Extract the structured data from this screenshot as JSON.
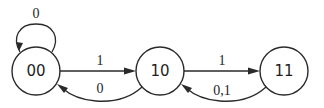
{
  "diagram": {
    "type": "state-transition",
    "states": [
      {
        "id": "s00",
        "label": "00",
        "cx": 36,
        "cy": 71,
        "r": 24
      },
      {
        "id": "s10",
        "label": "10",
        "cx": 160,
        "cy": 71,
        "r": 24
      },
      {
        "id": "s11",
        "label": "11",
        "cx": 284,
        "cy": 71,
        "r": 24
      }
    ],
    "transitions": [
      {
        "from": "00",
        "to": "00",
        "label": "0",
        "kind": "self-loop"
      },
      {
        "from": "00",
        "to": "10",
        "label": "1",
        "kind": "straight"
      },
      {
        "from": "10",
        "to": "00",
        "label": "0",
        "kind": "curved"
      },
      {
        "from": "10",
        "to": "11",
        "label": "1",
        "kind": "straight"
      },
      {
        "from": "11",
        "to": "10",
        "label": "0,1",
        "kind": "curved"
      }
    ]
  }
}
